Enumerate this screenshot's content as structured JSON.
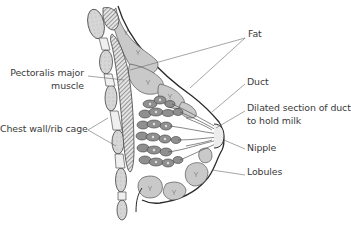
{
  "diagram": {
    "colors": {
      "background": "#ffffff",
      "outline": "#2b2b2b",
      "fat_fill": "#c9c9c9",
      "rib_fill": "#d8d8d8",
      "muscle_hatch": "#6d6d6d",
      "lobule_fill": "#8f8f8f",
      "leader_line": "#6a6a6a",
      "label_text": "#3a3a3a"
    },
    "labels": {
      "fat": "Fat",
      "duct": "Duct",
      "dilated_line1": "Dilated section of duct",
      "dilated_line2": "to hold milk",
      "nipple": "Nipple",
      "lobules": "Lobules",
      "pectoralis_line1": "Pectoralis major",
      "pectoralis_line2": "muscle",
      "chest_wall": "Chest wall/rib cage"
    }
  }
}
